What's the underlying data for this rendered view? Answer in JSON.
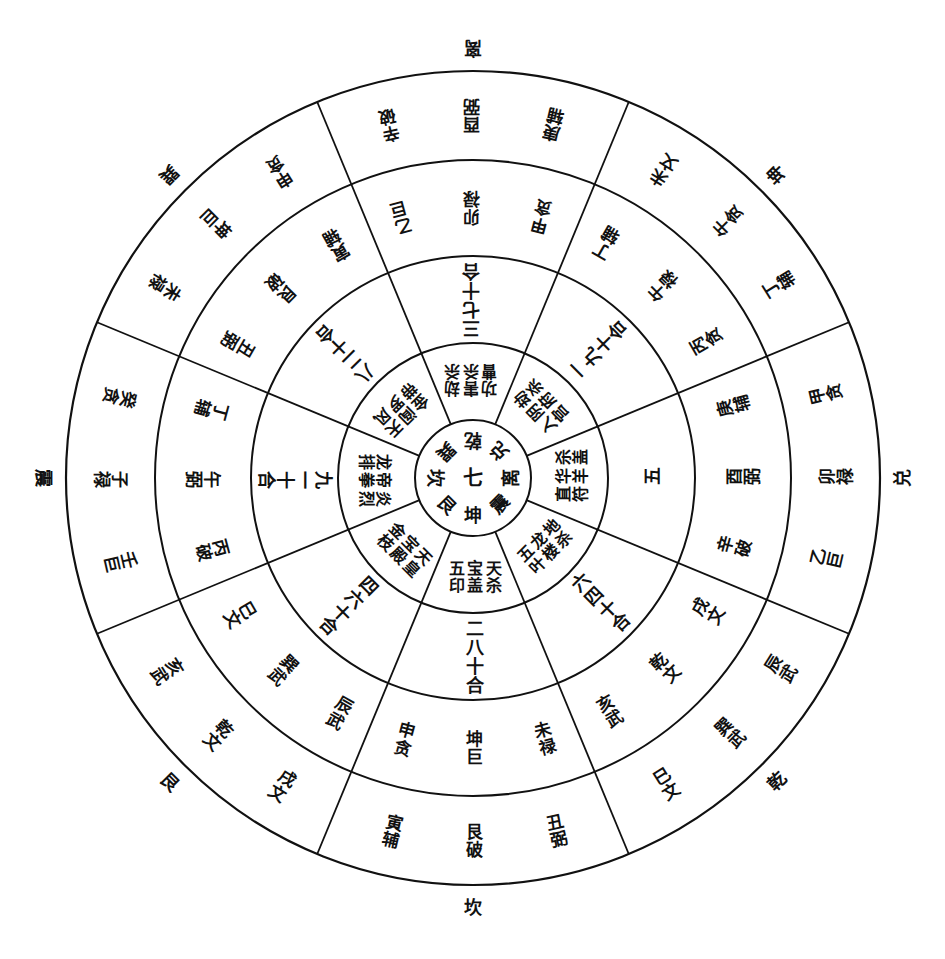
{
  "diagram": {
    "title": "",
    "center": {
      "x": 473,
      "y": 478
    },
    "radii": [
      58,
      135,
      222,
      318,
      407
    ],
    "line_color": "#111111",
    "background": "#ffffff",
    "sector_count": 8,
    "core": {
      "center_label": "七",
      "trigrams": [
        "坤",
        "艮",
        "坎",
        "巽",
        "乾",
        "兑",
        "离",
        "震"
      ]
    },
    "outer_labels": [
      {
        "angle": 0,
        "text": "坎"
      },
      {
        "angle": 45,
        "text": "乾"
      },
      {
        "angle": 90,
        "text": "兑"
      },
      {
        "angle": 135,
        "text": "坤"
      },
      {
        "angle": 180,
        "text": "离"
      },
      {
        "angle": 225,
        "text": "巽"
      },
      {
        "angle": 270,
        "text": "震"
      },
      {
        "angle": 315,
        "text": "艮"
      }
    ],
    "sectors": [
      {
        "name": "south-kan",
        "angle": 0,
        "ring2": [
          "天杀",
          "宝盖",
          "五印"
        ],
        "ring3": "二八十合",
        "ring4": [
          "未禄",
          "坤巨",
          "申贪"
        ],
        "ring5": [
          "丑弼",
          "艮破",
          "寅辅"
        ]
      },
      {
        "name": "southeast-qian",
        "angle": 45,
        "ring2": [
          "地杀",
          "龙楼",
          "五叶"
        ],
        "ring3": "六四十合",
        "ring4": [
          "戌文",
          "乾文",
          "亥武"
        ],
        "ring5": [
          "辰武",
          "巽武",
          "巳文"
        ]
      },
      {
        "name": "east-dui",
        "angle": 90,
        "ring2": [
          "杀盖",
          "华羊",
          "直符"
        ],
        "ring3": "五",
        "ring4": [
          "庚辅",
          "酉弼",
          "辛破"
        ],
        "ring5": [
          "甲贪",
          "卯禄",
          "乙巨"
        ]
      },
      {
        "name": "northeast-kun",
        "angle": 135,
        "ring2": [
          "劫杀",
          "阴府",
          "入宫"
        ],
        "ring3": "一九十合",
        "ring4": [
          "丁辅",
          "午禄",
          "丙贪"
        ],
        "ring5": [
          "未文",
          "午贪",
          "丁辅"
        ]
      },
      {
        "name": "north-li",
        "angle": 180,
        "ring2": [
          "劫杀",
          "害杀",
          "功曹"
        ],
        "ring3": "三七十合",
        "ring4": [
          "乙巨",
          "卯禄",
          "甲贪"
        ],
        "ring5": [
          "辛破",
          "酉弼",
          "庚辅"
        ]
      },
      {
        "name": "northwest-xun",
        "angle": 225,
        "ring2": [
          "天风",
          "阎罗",
          "金带"
        ],
        "ring3": "八二十合",
        "ring4": [
          "丑弼",
          "艮破",
          "寅辅"
        ],
        "ring5": [
          "未禄",
          "坤巨",
          "申贪"
        ]
      },
      {
        "name": "west-zhen",
        "angle": 270,
        "ring2": [
          "炎烈",
          "帝拳",
          "龙排"
        ],
        "ring3": "九一十合",
        "ring4": [
          "丙破",
          "午弼",
          "丁辅"
        ],
        "ring5": [
          "壬巨",
          "子禄",
          "癸贪"
        ]
      },
      {
        "name": "southwest-gen",
        "angle": 315,
        "ring2": [
          "天皇",
          "宝殿",
          "金枝"
        ],
        "ring3": "四六十合",
        "ring4": [
          "辰武",
          "巽武",
          "巳文"
        ],
        "ring5": [
          "戌文",
          "乾文",
          "亥武"
        ]
      }
    ]
  }
}
